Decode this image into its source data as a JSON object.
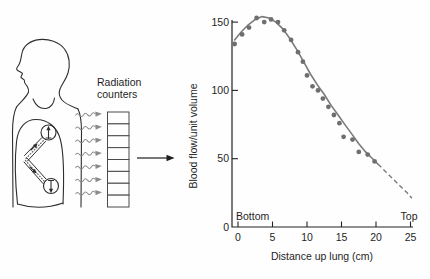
{
  "figure": {
    "labels": {
      "radiation_counters": "Radiation counters"
    },
    "illustration": {
      "counter_cells": 8,
      "ray_count": 7
    },
    "colors": {
      "ink": "#2e2e2e",
      "ray_gray": "#8a8a8a",
      "counter_stroke": "#4a4a4a",
      "dot_gray": "#6f6f6f",
      "curve_gray": "#7a7a7a",
      "axis_ink": "#222222"
    }
  },
  "chart_data": {
    "type": "scatter",
    "title": "",
    "xlabel": "Distance up lung (cm)",
    "ylabel": "Blood flow/unit volume",
    "xlim": [
      -1.5,
      26
    ],
    "ylim": [
      0,
      160
    ],
    "xticks": [
      0,
      5,
      10,
      15,
      20,
      25
    ],
    "yticks": [
      0,
      50,
      100,
      150
    ],
    "grid": false,
    "legend": "none",
    "annotations": [
      {
        "text": "Bottom",
        "x_cm": 0,
        "align": "left"
      },
      {
        "text": "Top",
        "x_cm": 25,
        "align": "right"
      }
    ],
    "points": [
      [
        -0.5,
        134
      ],
      [
        0.6,
        141
      ],
      [
        1.6,
        146
      ],
      [
        2.7,
        153
      ],
      [
        3.8,
        150
      ],
      [
        4.8,
        152
      ],
      [
        5.8,
        150
      ],
      [
        6.7,
        144
      ],
      [
        7.7,
        137
      ],
      [
        8.7,
        128
      ],
      [
        9.4,
        121
      ],
      [
        10.0,
        111
      ],
      [
        10.8,
        103
      ],
      [
        11.6,
        100
      ],
      [
        12.3,
        94
      ],
      [
        13.1,
        88
      ],
      [
        13.9,
        82
      ],
      [
        14.7,
        76
      ],
      [
        15.3,
        66
      ],
      [
        16.6,
        64
      ],
      [
        17.5,
        55
      ],
      [
        18.8,
        53
      ],
      [
        19.8,
        48
      ]
    ],
    "fit_curve_solid": [
      [
        -0.5,
        137
      ],
      [
        0.5,
        143
      ],
      [
        1.5,
        148
      ],
      [
        2.5,
        152
      ],
      [
        3.5,
        154
      ],
      [
        4.5,
        153
      ],
      [
        5.5,
        150
      ],
      [
        6.5,
        145
      ],
      [
        7.5,
        138
      ],
      [
        8.5,
        130
      ],
      [
        9.5,
        121
      ],
      [
        10.5,
        112
      ],
      [
        11.5,
        104
      ],
      [
        12.5,
        97
      ],
      [
        13.5,
        89
      ],
      [
        14.5,
        82
      ],
      [
        15.5,
        75
      ],
      [
        16.5,
        68
      ],
      [
        17.5,
        61
      ],
      [
        18.5,
        55
      ],
      [
        19.5,
        50
      ],
      [
        20.3,
        46
      ]
    ],
    "fit_curve_dashed": [
      [
        20.3,
        46
      ],
      [
        21.5,
        40
      ],
      [
        22.5,
        35
      ],
      [
        23.5,
        30
      ],
      [
        24.5,
        25
      ],
      [
        25.2,
        21
      ]
    ]
  }
}
